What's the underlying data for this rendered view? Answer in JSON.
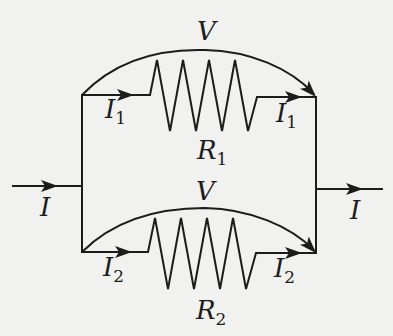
{
  "diagram": {
    "type": "parallel-resistor-circuit",
    "colors": {
      "background": "#f1f1ef",
      "ink": "#1c1c1c"
    },
    "input_current": {
      "symbol": "I",
      "subscript": ""
    },
    "output_current": {
      "symbol": "I",
      "subscript": ""
    },
    "branches": [
      {
        "id": "top",
        "voltage": {
          "symbol": "V"
        },
        "resistor": {
          "symbol": "R",
          "subscript": "1",
          "zigzag_peaks": 4
        },
        "current_in": {
          "symbol": "I",
          "subscript": "1"
        },
        "current_out": {
          "symbol": "I",
          "subscript": "1"
        }
      },
      {
        "id": "bottom",
        "voltage": {
          "symbol": "V"
        },
        "resistor": {
          "symbol": "R",
          "subscript": "2",
          "zigzag_peaks": 4
        },
        "current_in": {
          "symbol": "I",
          "subscript": "2"
        },
        "current_out": {
          "symbol": "I",
          "subscript": "2"
        }
      }
    ]
  }
}
